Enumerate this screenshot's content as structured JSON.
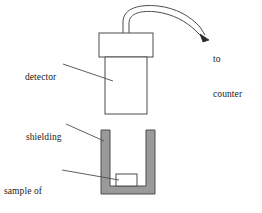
{
  "figure": {
    "background_color": "#ffffff",
    "line_color": "#4d4d4d",
    "shielding_fill": "#9a9a9a",
    "text_color": "#1a1a1a"
  },
  "labels": {
    "detector": "detector",
    "shielding": "shielding",
    "sample_line1": "sample of",
    "sample_line2": "radioactive",
    "sample_line3": "material",
    "to_counter_line1": "to",
    "to_counter_line2": "counter"
  },
  "parts": {
    "detector_cap": "detector-cap",
    "detector_body": "detector-body",
    "cable": "cable",
    "arrow": "signal-arrow",
    "shielding_block": "shielding-block",
    "sample_box": "sample-box"
  }
}
